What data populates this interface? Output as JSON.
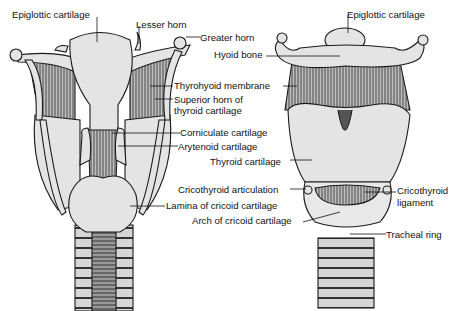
{
  "figure": {
    "views": [
      "posterior view (left)",
      "anterior view (right)"
    ],
    "colors": {
      "line": "#1a1a1a",
      "cartilage": "#e4e4e4",
      "muscle": "#7a7a7a",
      "background": "#ffffff"
    }
  },
  "labels": {
    "epiglottic_left": "Epiglottic cartilage",
    "lesser_horn": "Lesser horn",
    "greater_horn": "Greater horn",
    "epiglottic_right": "Epiglottic cartilage",
    "hyoid_bone": "Hyoid bone",
    "thyrohyoid_membrane": "Thyrohyoid membrane",
    "superior_horn_1": "Superior horn of",
    "superior_horn_2": "thyroid cartilage",
    "corniculate": "Corniculate cartilage",
    "arytenoid": "Arytenoid cartilage",
    "thyroid": "Thyroid cartilage",
    "cricothyroid_articulation": "Cricothyroid articulation",
    "cricothyroid_ligament_1": "Cricothyroid",
    "cricothyroid_ligament_2": "ligament",
    "lamina_cricoid": "Lamina of cricoid cartilage",
    "arch_cricoid": "Arch of cricoid cartilage",
    "tracheal_ring": "Tracheal ring"
  }
}
